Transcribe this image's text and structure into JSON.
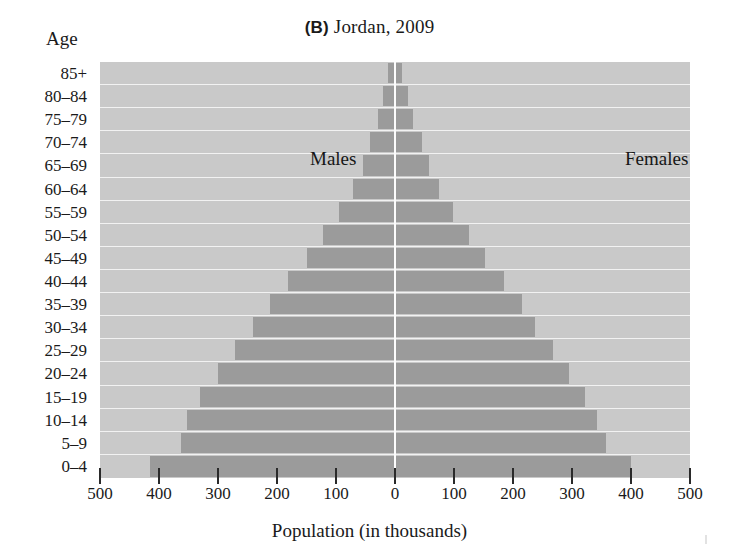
{
  "figure": {
    "panel_letter": "(B)",
    "title": "Jordan, 2009",
    "age_axis_caption": "Age",
    "series_labels": {
      "male": "Males",
      "female": "Females"
    }
  },
  "chart_data": {
    "type": "bar",
    "subtype": "population-pyramid",
    "title": "(B) Jordan, 2009",
    "xlabel": "Population (in thousands)",
    "ylabel": "Age",
    "xlim": [
      -500,
      500
    ],
    "xtick_labels": [
      "500",
      "400",
      "300",
      "200",
      "100",
      "0",
      "100",
      "200",
      "300",
      "400",
      "500"
    ],
    "xtick_values": [
      -500,
      -400,
      -300,
      -200,
      -100,
      0,
      100,
      200,
      300,
      400,
      500
    ],
    "grid": true,
    "legend": "in-plot",
    "units": "thousands",
    "categories": [
      "85+",
      "80–84",
      "75–79",
      "70–74",
      "65–69",
      "60–64",
      "55–59",
      "50–54",
      "45–49",
      "40–44",
      "35–39",
      "30–34",
      "25–29",
      "20–24",
      "15–19",
      "10–14",
      "5–9",
      "0–4"
    ],
    "series": [
      {
        "name": "Males",
        "side": "left",
        "values": [
          12,
          20,
          28,
          42,
          55,
          72,
          95,
          122,
          150,
          182,
          212,
          240,
          272,
          300,
          330,
          352,
          362,
          415
        ]
      },
      {
        "name": "Females",
        "side": "right",
        "values": [
          12,
          22,
          30,
          45,
          58,
          75,
          98,
          125,
          152,
          185,
          215,
          238,
          268,
          295,
          322,
          342,
          358,
          400
        ]
      }
    ],
    "colors": {
      "bar": "#9b9b9b",
      "plot_background": "#c9c9c9",
      "gridline": "#f2f2f2",
      "centerline": "#fdfdfd",
      "text": "#1a1a1a",
      "page_background": "#ffffff"
    }
  }
}
